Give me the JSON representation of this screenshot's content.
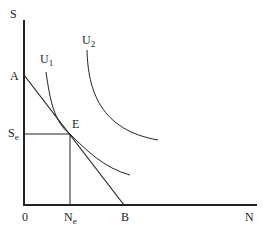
{
  "diagram": {
    "axes": {
      "y_label": "S",
      "x_label": "N",
      "origin_label": "0"
    },
    "points": {
      "A": "A",
      "B": "B",
      "E": "E"
    },
    "ticks": {
      "Se_main": "S",
      "Se_sub": "e",
      "Ne_main": "N",
      "Ne_sub": "e"
    },
    "curves": {
      "U1_main": "U",
      "U1_sub": "1",
      "U2_main": "U",
      "U2_sub": "2"
    },
    "colors": {
      "line": "#222222",
      "background": "#ffffff"
    }
  }
}
